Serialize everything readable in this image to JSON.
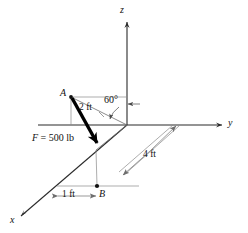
{
  "figure": {
    "background_color": "#ffffff",
    "line_color": "#2b2b2b",
    "thin_line_color": "#6e6e6e",
    "force_color": "#000000"
  },
  "axes": [
    {
      "name": "z-axis",
      "label": "z",
      "direction": "up"
    },
    {
      "name": "y-axis",
      "label": "y",
      "direction": "right"
    },
    {
      "name": "x-axis",
      "label": "x",
      "direction": "down-left"
    }
  ],
  "points": [
    {
      "name": "point-a",
      "label": "A"
    },
    {
      "name": "point-b",
      "label": "B"
    }
  ],
  "dimensions": [
    {
      "name": "dim-2ft",
      "label": "2 ft"
    },
    {
      "name": "dim-1ft",
      "label": "1 ft"
    },
    {
      "name": "dim-4ft",
      "label": "4 ft"
    }
  ],
  "angles": [
    {
      "name": "angle-60",
      "label": "60°"
    }
  ],
  "force": {
    "name": "force-vector",
    "symbol": "F",
    "equals": " = 500 lb",
    "label": "F = 500 lb",
    "magnitude": 500,
    "units": "lb",
    "applied_at": "A",
    "directed_toward": "B"
  }
}
